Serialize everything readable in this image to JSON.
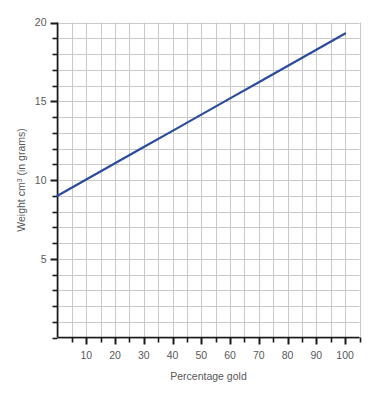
{
  "chart_data": {
    "type": "line",
    "title": "",
    "xlabel": "Percentage gold",
    "ylabel": "Weight cm3 (in grams)",
    "ylabel_parts": {
      "before": "Weight cm",
      "superscript": "3",
      "after": " (in grams)"
    },
    "xlim": [
      0,
      105
    ],
    "ylim": [
      0,
      20
    ],
    "grid": true,
    "grid_x_step": 5,
    "grid_y_step": 1,
    "legend": "none",
    "x_tick_labels": [
      "10",
      "20",
      "30",
      "40",
      "50",
      "60",
      "70",
      "80",
      "90",
      "100"
    ],
    "x_tick_values": [
      10,
      20,
      30,
      40,
      50,
      60,
      70,
      80,
      90,
      100
    ],
    "x_minor_ticks": [
      5,
      15,
      25,
      35,
      45,
      55,
      65,
      75,
      85,
      95,
      105
    ],
    "y_tick_labels": [
      "5",
      "10",
      "15",
      "20"
    ],
    "y_tick_values": [
      5,
      10,
      15,
      20
    ],
    "y_minor_ticks": [
      1,
      2,
      3,
      4,
      6,
      7,
      8,
      9,
      11,
      12,
      13,
      14,
      16,
      17,
      18,
      19
    ],
    "series": [
      {
        "name": "Weight of 1 cm3 alloy",
        "color": "#2b4b9b",
        "x": [
          0,
          10,
          20,
          30,
          40,
          50,
          60,
          70,
          80,
          90,
          100
        ],
        "values": [
          9.0,
          10.03,
          11.06,
          12.09,
          13.12,
          14.15,
          15.18,
          16.21,
          17.24,
          18.27,
          19.3
        ]
      }
    ],
    "line_endpoints": {
      "start": {
        "x": 0,
        "y": 9.0
      },
      "end": {
        "x": 100,
        "y": 19.3
      }
    }
  },
  "colors": {
    "line": "#2b4b9b",
    "axis": "#1a1a1a",
    "grid": "#c9c9c9",
    "text": "#58585a",
    "background": "#ffffff"
  }
}
